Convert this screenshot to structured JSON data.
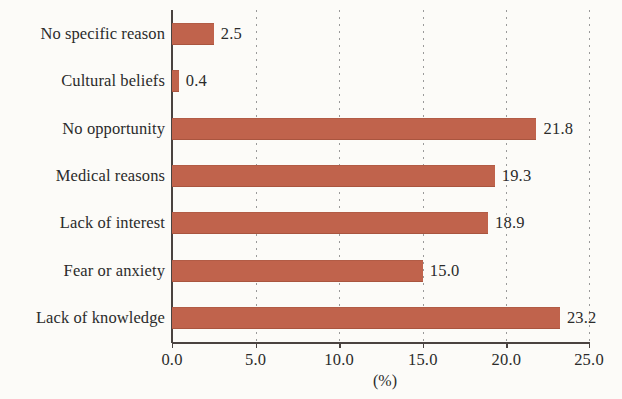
{
  "chart_data": {
    "type": "bar",
    "orientation": "horizontal",
    "title": "",
    "subtitle": "",
    "xlabel": "(%)",
    "ylabel": "",
    "xlim": [
      0.0,
      25.0
    ],
    "xticks": [
      "0.0",
      "5.0",
      "10.0",
      "15.0",
      "20.0",
      "25.0"
    ],
    "xtick_values": [
      0.0,
      5.0,
      10.0,
      15.0,
      20.0,
      25.0
    ],
    "grid": "vertical-dotted",
    "legend": "none",
    "categories": [
      "No specific reason",
      "Cultural beliefs",
      "No opportunity",
      "Medical reasons",
      "Lack of interest",
      "Fear or anxiety",
      "Lack of knowledge"
    ],
    "values": [
      2.5,
      0.4,
      21.8,
      19.3,
      18.9,
      15.0,
      23.2
    ],
    "value_labels": [
      "2.5",
      "0.4",
      "21.8",
      "19.3",
      "18.9",
      "15.0",
      "23.2"
    ],
    "bar_color": "#c0634c",
    "background_color": "#fcfbf8",
    "axis_color": "#4a4340",
    "text_color": "#2b2b2b"
  }
}
